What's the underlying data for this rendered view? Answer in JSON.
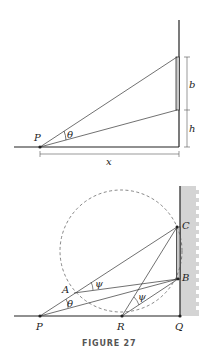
{
  "figure_top": {
    "labels": {
      "point_p": "P",
      "angle": "θ",
      "height_b": "b",
      "height_h": "h",
      "distance_x": "x"
    }
  },
  "figure_bottom": {
    "labels": {
      "point_a": "A",
      "point_b": "B",
      "point_c": "C",
      "point_p": "P",
      "point_q": "Q",
      "point_r": "R",
      "angle_theta": "θ",
      "angle_psi_1": "ψ",
      "angle_psi_2": "ψ"
    }
  },
  "caption": "FIGURE 27",
  "colors": {
    "line": "#222222",
    "bar": "#c8c8c8",
    "wall_hatch": "#d4d4d4",
    "circle": "#555555"
  }
}
